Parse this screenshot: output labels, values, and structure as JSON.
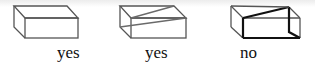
{
  "figures": [
    {
      "label": "yes",
      "description": "plain rectangular box outline"
    },
    {
      "label": "yes",
      "description": "box outline with two gray diagonal lines crossing the front/top faces"
    },
    {
      "label": "no",
      "description": "box outline with bold edges and a bold diagonal across the top face"
    }
  ],
  "colors": {
    "edge": "#555555",
    "diagonal_gray": "#6a6a6a",
    "bold": "#111111",
    "text": "#111111"
  }
}
